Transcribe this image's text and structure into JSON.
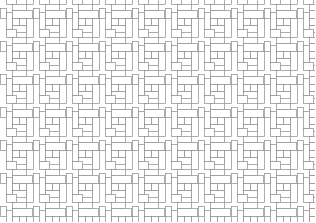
{
  "image": {
    "width": 315,
    "height": 222,
    "background": "#ffffff",
    "stroke_color": "#8a8a8a",
    "description": "Interlocking rectangle tessellation pattern (line art)"
  },
  "pattern": {
    "origin": [
      6,
      4
    ],
    "tile_width": 33,
    "tile_height": 33,
    "columns": 10,
    "rows": 7,
    "shapes": [
      {
        "x": 0,
        "y": 8,
        "w": 6,
        "h": 17
      },
      {
        "x": 6,
        "y": 0,
        "w": 14,
        "h": 6
      },
      {
        "x": 6,
        "y": 6,
        "w": 20,
        "h": 8
      },
      {
        "x": 20,
        "y": 14,
        "w": 7,
        "h": 19
      },
      {
        "x": 6,
        "y": 14,
        "w": 7,
        "h": 7
      },
      {
        "x": 13,
        "y": 14,
        "w": 7,
        "h": 7
      },
      {
        "x": 6,
        "y": 21,
        "w": 14,
        "h": 7
      },
      {
        "x": 27,
        "y": 4,
        "w": 6,
        "h": 10
      },
      {
        "x": 0,
        "y": 25,
        "w": 10,
        "h": 8
      }
    ]
  }
}
